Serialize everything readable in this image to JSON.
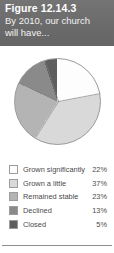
{
  "header": {
    "title": "Figure 12.14.3",
    "subtitle_lines": [
      "By 2010, our church",
      "will have..."
    ],
    "background_color": "#6e6e6e",
    "text_color": "#ffffff"
  },
  "chart_data": {
    "type": "pie",
    "title": "Figure 12.14.3",
    "subtitle": "By 2010, our church will have...",
    "categories": [
      "Grown significantly",
      "Grown a little",
      "Remained stable",
      "Declined",
      "Closed"
    ],
    "values": [
      22,
      37,
      23,
      13,
      5
    ],
    "value_labels": [
      "22%",
      "37%",
      "23%",
      "13%",
      "5%"
    ],
    "unit": "%",
    "colors": [
      "#fdfdfd",
      "#d9d9d9",
      "#b4b4b4",
      "#8a8a8a",
      "#5e5e5e"
    ],
    "start_angle_deg": 0,
    "direction": "clockwise",
    "legend_position": "bottom",
    "grid": false
  },
  "legend": {
    "rows": [
      {
        "label": "Grown significantly",
        "value": "22%",
        "color": "#fdfdfd"
      },
      {
        "label": "Grown a little",
        "value": "37%",
        "color": "#d9d9d9"
      },
      {
        "label": "Remained stable",
        "value": "23%",
        "color": "#b4b4b4"
      },
      {
        "label": "Declined",
        "value": "13%",
        "color": "#8a8a8a"
      },
      {
        "label": "Closed",
        "value": "5%",
        "color": "#5e5e5e"
      }
    ]
  }
}
